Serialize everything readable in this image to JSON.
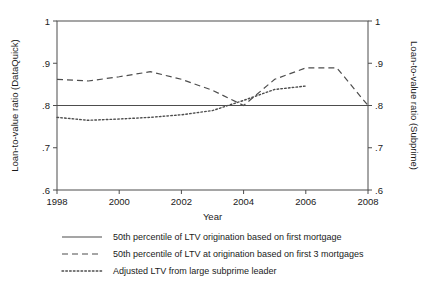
{
  "chart_data": {
    "type": "line",
    "title": "",
    "xlabel": "Year",
    "ylabel": "Loan-to-value ratio (DataQuick)",
    "ylabel_right": "Loan-to-value ratio (Subprime)",
    "grid": false,
    "legend_position": "bottom",
    "xlim": [
      1998,
      2008
    ],
    "ylim": [
      0.6,
      1.0
    ],
    "ylim_right": [
      0.6,
      1.0
    ],
    "xticks": [
      1998,
      2000,
      2002,
      2004,
      2006,
      2008
    ],
    "xtick_labels": [
      "1998",
      "2000",
      "2002",
      "2004",
      "2006",
      "2008"
    ],
    "yticks": [
      0.6,
      0.7,
      0.8,
      0.9,
      1.0
    ],
    "ytick_labels": [
      ".6",
      ".7",
      ".8",
      ".9",
      "1"
    ],
    "yticks_right": [
      0.6,
      0.7,
      0.8,
      0.9,
      1.0
    ],
    "ytick_labels_right": [
      ".6",
      ".7",
      ".8",
      ".9",
      "1"
    ],
    "x": [
      1998,
      1999,
      2000,
      2001,
      2002,
      2003,
      2004,
      2005,
      2006,
      2007,
      2008
    ],
    "series": [
      {
        "name": "50th percentile of LTV origination based on first mortgage",
        "style": "solid",
        "color": "#4d4d4d",
        "x": [
          1998,
          1999,
          2000,
          2001,
          2002,
          2003,
          2004,
          2005,
          2006,
          2007,
          2008
        ],
        "values": [
          0.8,
          0.8,
          0.8,
          0.8,
          0.8,
          0.8,
          0.8,
          0.8,
          0.8,
          0.8,
          0.8
        ]
      },
      {
        "name": "50th percentile of LTV at origination based on first 3 mortgages",
        "style": "dashed",
        "color": "#4d4d4d",
        "x": [
          1998,
          1999,
          2000,
          2001,
          2002,
          2003,
          2004,
          2005,
          2006,
          2007,
          2008
        ],
        "values": [
          0.862,
          0.858,
          0.868,
          0.88,
          0.862,
          0.836,
          0.8,
          0.862,
          0.889,
          0.889,
          0.8
        ]
      },
      {
        "name": "Adjusted LTV from large subprime leader",
        "style": "dotted",
        "color": "#4d4d4d",
        "x": [
          1998,
          1999,
          2000,
          2001,
          2002,
          2003,
          2004,
          2005,
          2006
        ],
        "values": [
          0.772,
          0.765,
          0.768,
          0.772,
          0.778,
          0.788,
          0.812,
          0.838,
          0.846
        ]
      }
    ],
    "legend": [
      {
        "style": "solid",
        "label": "50th percentile of LTV origination based on first mortgage"
      },
      {
        "style": "dashed",
        "label": "50th percentile of LTV at origination based on first 3 mortgages"
      },
      {
        "style": "dotted",
        "label": "Adjusted LTV from large subprime leader"
      }
    ]
  }
}
